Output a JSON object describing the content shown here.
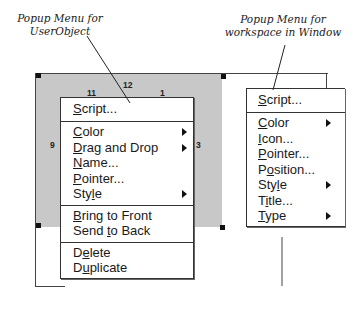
{
  "captions": {
    "left": [
      "Popup Menu for",
      "UserObject"
    ],
    "right": [
      "Popup Menu for",
      "workspace in Window"
    ]
  },
  "clock_numbers": [
    "11",
    "12",
    "1",
    "9",
    "3"
  ],
  "userobject_menu": {
    "groups": [
      [
        {
          "label": "Script...",
          "mnemonic_index": 0,
          "submenu": false
        }
      ],
      [
        {
          "label": "Color",
          "mnemonic_index": 0,
          "submenu": true
        },
        {
          "label": "Drag and Drop",
          "mnemonic_index": 0,
          "submenu": true
        },
        {
          "label": "Name...",
          "mnemonic_index": 0,
          "submenu": false
        },
        {
          "label": "Pointer...",
          "mnemonic_index": 0,
          "submenu": false
        },
        {
          "label": "Style",
          "mnemonic_index": 3,
          "submenu": true
        }
      ],
      [
        {
          "label": "Bring to Front",
          "mnemonic_index": 0,
          "submenu": false
        },
        {
          "label": "Send to Back",
          "mnemonic_index": 5,
          "submenu": false
        }
      ],
      [
        {
          "label": "Delete",
          "mnemonic_index": 1,
          "submenu": false
        },
        {
          "label": "Duplicate",
          "mnemonic_index": 1,
          "submenu": false
        }
      ]
    ]
  },
  "window_menu": {
    "groups": [
      [
        {
          "label": "Script...",
          "mnemonic_index": 0,
          "submenu": false
        }
      ],
      [
        {
          "label": "Color",
          "mnemonic_index": 0,
          "submenu": true
        },
        {
          "label": "Icon...",
          "mnemonic_index": 0,
          "submenu": false
        },
        {
          "label": "Pointer...",
          "mnemonic_index": 0,
          "submenu": false
        },
        {
          "label": "Position...",
          "mnemonic_index": 1,
          "submenu": false
        },
        {
          "label": "Style",
          "mnemonic_index": 3,
          "submenu": true
        },
        {
          "label": "Title...",
          "mnemonic_index": 1,
          "submenu": false
        },
        {
          "label": "Type",
          "mnemonic_index": 0,
          "submenu": true
        }
      ]
    ]
  }
}
